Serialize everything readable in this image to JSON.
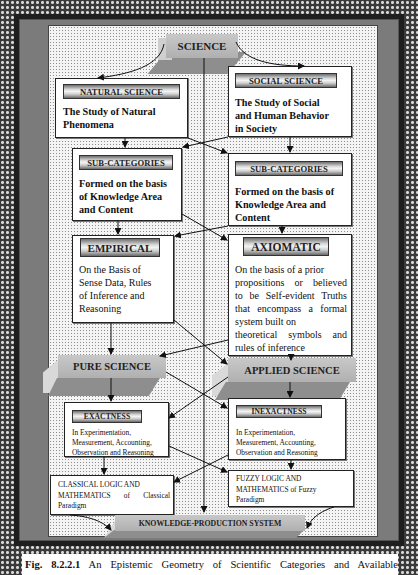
{
  "diagram": {
    "root": {
      "label": "SCIENCE"
    },
    "branches": [
      {
        "id": "natural",
        "title": "NATURAL SCIENCE",
        "description_lines": [
          "The Study of Natural",
          "Phenomena"
        ]
      },
      {
        "id": "social",
        "title": "SOCIAL SCIENCE",
        "description_lines": [
          "The Study of Social",
          "and Human Behavior",
          "in Society"
        ]
      }
    ],
    "subcategories": [
      {
        "id": "sub-left",
        "title": "SUB-CATEGORIES",
        "description_lines": [
          "Formed on the basis",
          "of Knowledge Area",
          "and Content"
        ]
      },
      {
        "id": "sub-right",
        "title": "SUB-CATEGORIES",
        "description_lines": [
          "Formed on the basis of",
          "Knowledge Area and",
          "Content"
        ]
      }
    ],
    "methods": [
      {
        "id": "empirical",
        "title": "EMPIRICAL",
        "description_lines": [
          "On the Basis of",
          "Sense Data, Rules",
          "of Inference and",
          "Reasoning"
        ]
      },
      {
        "id": "axiomatic",
        "title": "AXIOMATIC",
        "description_lines": [
          "On the basis of a prior",
          "propositions or believed",
          "to be Self-evident Truths",
          "that encompass a formal",
          "system built on",
          "theoretical symbols and",
          "rules of inference"
        ]
      }
    ],
    "science_types": [
      {
        "id": "pure",
        "label": "PURE SCIENCE"
      },
      {
        "id": "applied",
        "label": "APPLIED SCIENCE"
      }
    ],
    "precision": [
      {
        "id": "exactness",
        "title": "EXACTNESS",
        "description_lines": [
          "In Experimentation,",
          "Measurement, Accounting,",
          "Observation and Reasoning"
        ]
      },
      {
        "id": "inexactness",
        "title": "INEXACTNESS",
        "description_lines": [
          "In Experimentation,",
          "Measurement, Accounting,",
          "Observation and Reasoning"
        ]
      }
    ],
    "logic": [
      {
        "id": "classical",
        "description_lines": [
          "CLASSICAL LOGIC AND",
          "MATHEMATICS of Classical",
          "Paradigm"
        ]
      },
      {
        "id": "fuzzy",
        "description_lines": [
          "FUZZY LOGIC AND",
          "MATHEMATICS of Fuzzy",
          "Paradigm"
        ]
      }
    ],
    "sink": {
      "label": "KNOWLEDGE-PRODUCTION SYSTEM"
    }
  },
  "caption": {
    "figure_number": "Fig. 8.2.2.1",
    "text": "An Epistemic Geometry of Scientific Categories and Available"
  },
  "colors": {
    "canvas": "#f4f4f4",
    "frame": "#7b7b7b",
    "slab_top": "#bcbcbc",
    "slab_front": "#8e8e8e",
    "box_border": "#222222"
  }
}
